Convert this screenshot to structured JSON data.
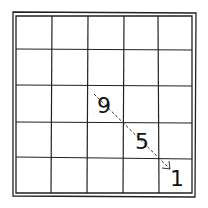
{
  "diagram": {
    "type": "grid-puzzle",
    "grid": {
      "rows": 5,
      "cols": 5,
      "border": "double",
      "style": "hand-drawn",
      "line_color": "#222222"
    },
    "cells": [
      {
        "row": 2,
        "col": 2,
        "value": "9"
      },
      {
        "row": 3,
        "col": 3,
        "value": "5"
      },
      {
        "row": 4,
        "col": 4,
        "value": "1"
      }
    ],
    "arrow": {
      "style": "dashed",
      "from": {
        "row": 2,
        "col": 2
      },
      "to": {
        "row": 4,
        "col": 4
      },
      "direction": "down-right"
    }
  },
  "labels": {
    "n9": "9",
    "n5": "5",
    "n1": "1"
  }
}
